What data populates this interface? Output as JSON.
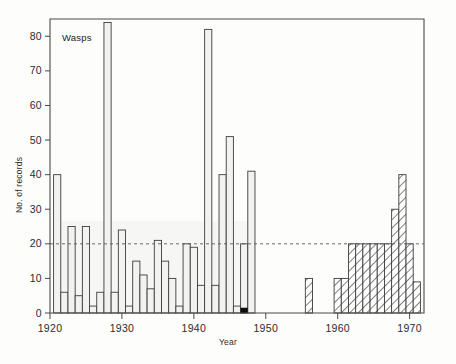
{
  "chart_data": {
    "type": "bar",
    "title": "Wasps",
    "xlabel": "Year",
    "ylabel": "No. of records",
    "xlim": [
      1920,
      1972
    ],
    "ylim": [
      0,
      85
    ],
    "yticks": [
      0,
      10,
      20,
      30,
      40,
      50,
      60,
      70,
      80
    ],
    "ytick_labels": [
      "0",
      "10",
      "20",
      "30",
      "40",
      "50",
      "60",
      "70",
      "80"
    ],
    "xticks": [
      1920,
      1930,
      1940,
      1950,
      1960,
      1970
    ],
    "xtick_labels": [
      "1920",
      "1930",
      "1940",
      "1950",
      "1960",
      "1970"
    ],
    "grid": false,
    "legend": null,
    "reference_line": {
      "axis": "y",
      "value": 20,
      "style": "dashed"
    },
    "series": [
      {
        "name": "early records",
        "style": "open",
        "x": [
          1921,
          1922,
          1923,
          1924,
          1925,
          1926,
          1927,
          1928,
          1929,
          1930,
          1931,
          1932,
          1933,
          1934,
          1935,
          1936,
          1937,
          1938,
          1939,
          1940,
          1941,
          1942,
          1943,
          1944,
          1945,
          1946,
          1947,
          1948
        ],
        "values": [
          40,
          6,
          25,
          5,
          25,
          2,
          6,
          84,
          6,
          24,
          2,
          15,
          11,
          7,
          21,
          15,
          10,
          2,
          20,
          19,
          8,
          82,
          8,
          40,
          51,
          2,
          20,
          41
        ]
      },
      {
        "name": "later records",
        "style": "hatched",
        "x": [
          1956,
          1960,
          1961,
          1962,
          1963,
          1964,
          1965,
          1966,
          1967,
          1968,
          1969,
          1970,
          1971
        ],
        "values": [
          10,
          10,
          10,
          20,
          20,
          20,
          20,
          20,
          20,
          30,
          40,
          20,
          9
        ]
      }
    ],
    "annotations": [
      {
        "label": "black marker",
        "x": 1947,
        "y": 0
      }
    ]
  },
  "figure": {
    "panel_label": "Wasps",
    "y_axis_label": "No. of records",
    "x_axis_label": "Year"
  }
}
